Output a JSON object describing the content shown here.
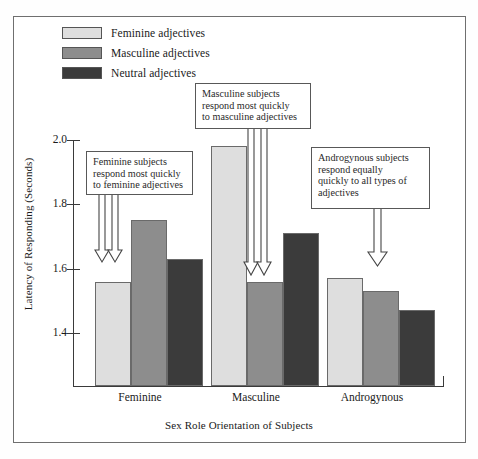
{
  "legend": {
    "items": [
      {
        "label": "Feminine adjectives",
        "color": "#dedede",
        "icon": "legend-swatch-feminine"
      },
      {
        "label": "Masculine adjectives",
        "color": "#8d8d8d",
        "icon": "legend-swatch-masculine"
      },
      {
        "label": "Neutral adjectives",
        "color": "#3b3b3b",
        "icon": "legend-swatch-neutral"
      }
    ]
  },
  "axes": {
    "ylabel": "Latency of Responding (Seconds)",
    "xlabel": "Sex Role Orientation of Subjects",
    "yticks": [
      "2.0",
      "1.8",
      "1.6",
      "1.4"
    ],
    "xticklabels": [
      "Feminine",
      "Masculine",
      "Androgynous"
    ]
  },
  "callouts": [
    {
      "id": "callout-feminine",
      "text": "Feminine subjects\nrespond most quickly\nto feminine adjectives"
    },
    {
      "id": "callout-masculine",
      "text": "Masculine subjects\nrespond most quickly\nto masculine adjectives"
    },
    {
      "id": "callout-androgynous",
      "text": "Androgynous subjects\nrespond equally\nquickly to all types of\nadjectives"
    }
  ],
  "chart_data": {
    "type": "bar",
    "title": "",
    "xlabel": "Sex Role Orientation of Subjects",
    "ylabel": "Latency of Responding (Seconds)",
    "categories": [
      "Feminine",
      "Masculine",
      "Androgynous"
    ],
    "series": [
      {
        "name": "Feminine adjectives",
        "color": "#dedede",
        "values": [
          1.56,
          1.98,
          1.57
        ]
      },
      {
        "name": "Masculine adjectives",
        "color": "#8d8d8d",
        "values": [
          1.75,
          1.56,
          1.53
        ]
      },
      {
        "name": "Neutral adjectives",
        "color": "#3b3b3b",
        "values": [
          1.63,
          1.71,
          1.47
        ]
      }
    ],
    "ylim": [
      1.238,
      2.04
    ],
    "ytick_values": [
      2.0,
      1.8,
      1.6,
      1.4
    ],
    "grid": false,
    "legend_position": "top-left",
    "annotations": [
      "Feminine subjects respond most quickly to feminine adjectives",
      "Masculine subjects respond most quickly to masculine adjectives",
      "Androgynous subjects respond equally quickly to all types of adjectives"
    ]
  }
}
